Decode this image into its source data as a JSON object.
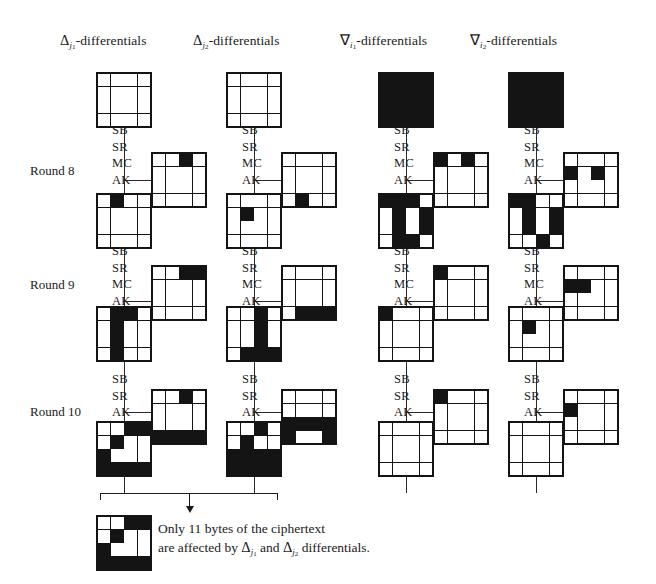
{
  "figure": {
    "ink_color": "#141414",
    "background": "#ffffff"
  },
  "columns": [
    {
      "id": "delta-j1",
      "symbol": "Δ",
      "sub": "j",
      "subsub": "1",
      "suffix": "-differentials"
    },
    {
      "id": "delta-j2",
      "symbol": "Δ",
      "sub": "j",
      "subsub": "2",
      "suffix": "-differentials"
    },
    {
      "id": "nabla-i1",
      "symbol": "∇",
      "sub": "i",
      "subsub": "1",
      "suffix": "-differentials"
    },
    {
      "id": "nabla-i2",
      "symbol": "∇",
      "sub": "i",
      "subsub": "2",
      "suffix": "-differentials"
    }
  ],
  "rounds": [
    {
      "id": "round-8",
      "label": "Round 8",
      "ops": [
        "SB",
        "SR",
        "MC",
        "AK"
      ]
    },
    {
      "id": "round-9",
      "label": "Round 9",
      "ops": [
        "SB",
        "SR",
        "MC",
        "AK"
      ]
    },
    {
      "id": "round-10",
      "label": "Round 10",
      "ops": [
        "SB",
        "SR",
        "AK"
      ]
    }
  ],
  "grids": {
    "c1_top": [
      [
        0,
        0,
        0,
        0
      ],
      [
        0,
        0,
        0,
        0
      ],
      [
        0,
        0,
        0,
        0
      ],
      [
        0,
        0,
        0,
        0
      ]
    ],
    "c1_r8_key": [
      [
        0,
        0,
        1,
        0
      ],
      [
        0,
        0,
        0,
        0
      ],
      [
        0,
        0,
        0,
        0
      ],
      [
        0,
        0,
        0,
        0
      ]
    ],
    "c1_r8_state": [
      [
        0,
        1,
        0,
        0
      ],
      [
        0,
        0,
        0,
        0
      ],
      [
        0,
        0,
        0,
        0
      ],
      [
        0,
        0,
        0,
        0
      ]
    ],
    "c1_r9_key": [
      [
        0,
        0,
        1,
        1
      ],
      [
        0,
        0,
        0,
        0
      ],
      [
        0,
        0,
        0,
        0
      ],
      [
        0,
        0,
        0,
        0
      ]
    ],
    "c1_r9_state": [
      [
        0,
        1,
        1,
        0
      ],
      [
        0,
        1,
        0,
        0
      ],
      [
        0,
        1,
        0,
        0
      ],
      [
        0,
        1,
        0,
        0
      ]
    ],
    "c1_r10_key": [
      [
        0,
        0,
        1,
        0
      ],
      [
        0,
        0,
        0,
        0
      ],
      [
        0,
        0,
        0,
        0
      ],
      [
        1,
        1,
        1,
        1
      ]
    ],
    "c1_r10_state": [
      [
        0,
        0,
        1,
        1
      ],
      [
        0,
        1,
        0,
        0
      ],
      [
        1,
        0,
        0,
        0
      ],
      [
        1,
        1,
        1,
        1
      ]
    ],
    "c2_top": [
      [
        0,
        0,
        0,
        0
      ],
      [
        0,
        0,
        0,
        0
      ],
      [
        0,
        0,
        0,
        0
      ],
      [
        0,
        0,
        0,
        0
      ]
    ],
    "c2_r8_key": [
      [
        0,
        0,
        0,
        0
      ],
      [
        0,
        0,
        0,
        0
      ],
      [
        0,
        0,
        0,
        0
      ],
      [
        0,
        1,
        0,
        0
      ]
    ],
    "c2_r8_state": [
      [
        0,
        0,
        0,
        0
      ],
      [
        0,
        1,
        0,
        0
      ],
      [
        0,
        0,
        0,
        0
      ],
      [
        0,
        0,
        0,
        0
      ]
    ],
    "c2_r9_key": [
      [
        0,
        0,
        0,
        0
      ],
      [
        0,
        0,
        0,
        0
      ],
      [
        0,
        0,
        0,
        0
      ],
      [
        0,
        1,
        1,
        1
      ]
    ],
    "c2_r9_state": [
      [
        0,
        0,
        1,
        0
      ],
      [
        0,
        0,
        1,
        0
      ],
      [
        0,
        0,
        1,
        0
      ],
      [
        0,
        1,
        1,
        1
      ]
    ],
    "c2_r10_key": [
      [
        0,
        0,
        0,
        0
      ],
      [
        0,
        0,
        0,
        0
      ],
      [
        1,
        1,
        1,
        1
      ],
      [
        1,
        0,
        0,
        1
      ]
    ],
    "c2_r10_state": [
      [
        0,
        0,
        1,
        0
      ],
      [
        0,
        1,
        0,
        0
      ],
      [
        1,
        1,
        1,
        1
      ],
      [
        1,
        1,
        1,
        1
      ]
    ],
    "c3_top": [
      [
        1,
        1,
        1,
        1
      ],
      [
        1,
        1,
        1,
        1
      ],
      [
        1,
        1,
        1,
        1
      ],
      [
        1,
        1,
        1,
        1
      ]
    ],
    "c3_r8_key": [
      [
        1,
        0,
        1,
        0
      ],
      [
        0,
        0,
        0,
        0
      ],
      [
        0,
        0,
        0,
        0
      ],
      [
        0,
        0,
        0,
        0
      ]
    ],
    "c3_r8_state": [
      [
        1,
        1,
        1,
        0
      ],
      [
        0,
        1,
        0,
        1
      ],
      [
        0,
        1,
        0,
        1
      ],
      [
        0,
        1,
        1,
        0
      ]
    ],
    "c3_r9_key": [
      [
        1,
        0,
        0,
        0
      ],
      [
        0,
        0,
        0,
        0
      ],
      [
        0,
        0,
        0,
        0
      ],
      [
        0,
        0,
        0,
        0
      ]
    ],
    "c3_r9_state": [
      [
        1,
        0,
        0,
        0
      ],
      [
        0,
        0,
        0,
        0
      ],
      [
        0,
        0,
        0,
        0
      ],
      [
        0,
        0,
        0,
        0
      ]
    ],
    "c3_r10_key": [
      [
        1,
        0,
        0,
        0
      ],
      [
        0,
        0,
        0,
        0
      ],
      [
        0,
        0,
        0,
        0
      ],
      [
        0,
        0,
        0,
        0
      ]
    ],
    "c3_r10_state": [
      [
        0,
        0,
        0,
        0
      ],
      [
        0,
        0,
        0,
        0
      ],
      [
        0,
        0,
        0,
        0
      ],
      [
        0,
        0,
        0,
        0
      ]
    ],
    "c4_top": [
      [
        1,
        1,
        1,
        1
      ],
      [
        1,
        1,
        1,
        1
      ],
      [
        1,
        1,
        1,
        1
      ],
      [
        1,
        1,
        1,
        1
      ]
    ],
    "c4_r8_key": [
      [
        0,
        0,
        0,
        0
      ],
      [
        1,
        0,
        1,
        0
      ],
      [
        0,
        0,
        0,
        0
      ],
      [
        0,
        0,
        0,
        0
      ]
    ],
    "c4_r8_state": [
      [
        1,
        1,
        0,
        0
      ],
      [
        0,
        1,
        0,
        1
      ],
      [
        0,
        1,
        0,
        1
      ],
      [
        0,
        0,
        1,
        0
      ]
    ],
    "c4_r9_key": [
      [
        0,
        0,
        0,
        0
      ],
      [
        1,
        1,
        0,
        0
      ],
      [
        0,
        0,
        0,
        0
      ],
      [
        0,
        0,
        0,
        0
      ]
    ],
    "c4_r9_state": [
      [
        0,
        0,
        0,
        0
      ],
      [
        0,
        1,
        0,
        0
      ],
      [
        0,
        0,
        0,
        0
      ],
      [
        0,
        0,
        0,
        0
      ]
    ],
    "c4_r10_key": [
      [
        0,
        0,
        0,
        0
      ],
      [
        1,
        0,
        0,
        0
      ],
      [
        0,
        0,
        0,
        0
      ],
      [
        0,
        0,
        0,
        0
      ]
    ],
    "c4_r10_state": [
      [
        0,
        0,
        0,
        0
      ],
      [
        0,
        0,
        0,
        0
      ],
      [
        0,
        0,
        0,
        0
      ],
      [
        0,
        0,
        0,
        0
      ]
    ]
  },
  "legend": {
    "swatch": [
      [
        0,
        0,
        1,
        1
      ],
      [
        0,
        1,
        0,
        0
      ],
      [
        1,
        0,
        0,
        0
      ],
      [
        1,
        1,
        1,
        1
      ]
    ],
    "line1": "Only 11 bytes of the ciphertext",
    "line2_a": "are affected by ",
    "line2_delta1_sym": "Δ",
    "line2_delta1_sub": "j",
    "line2_delta1_subsub": "1",
    "line2_b": " and ",
    "line2_delta2_sym": "Δ",
    "line2_delta2_sub": "j",
    "line2_delta2_subsub": "2",
    "line2_c": " differentials."
  }
}
